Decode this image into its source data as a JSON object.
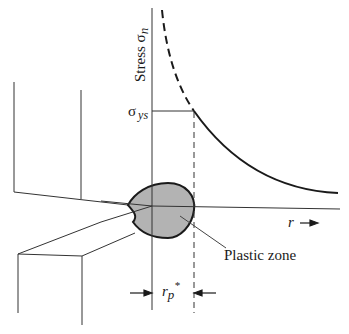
{
  "figure": {
    "type": "crack-tip plastic zone diagram",
    "y_axis_label": "Stress σ",
    "y_axis_label_sub": "n",
    "yield_stress_label": "σ",
    "yield_stress_sub": "ys",
    "r_axis_label": "r",
    "plastic_zone_label": "Plastic zone",
    "plastic_zone_size_label": "r",
    "plastic_zone_size_sub": "p",
    "plastic_zone_size_sup": "*"
  },
  "colors": {
    "line": "#1a1a1a",
    "thin_line": "#333333",
    "plastic_zone_fill": "#b3b3b3"
  }
}
